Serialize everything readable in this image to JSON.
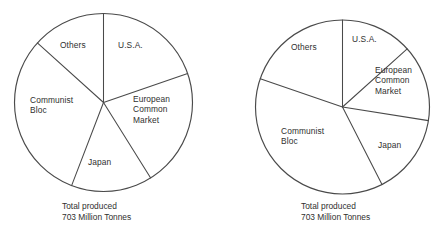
{
  "figure": {
    "width": 448,
    "height": 240,
    "background": "#ffffff",
    "stroke_color": "#4a4a4a",
    "text_color": "#30302f"
  },
  "chart_data": [
    {
      "type": "pie",
      "id": "pie-left",
      "title": "",
      "caption": "Total produced\n703 Million Tonnes",
      "total_label": "Total produced",
      "total_value_label": "703 Million Tonnes",
      "total_value": 703,
      "units": "Million Tonnes",
      "grid": false,
      "legend": "none",
      "labels_position": "inside-slice",
      "start_angle_deg": 0,
      "direction": "clockwise",
      "center": {
        "x": 103.5,
        "y": 102.5
      },
      "radius": 89,
      "categories": [
        "U.S.A.",
        "European Common Market",
        "Japan",
        "Communist Bloc",
        "Others"
      ],
      "values": [
        19.7,
        21.4,
        14.7,
        30.8,
        13.4
      ],
      "slices": [
        {
          "label": "U.S.A.",
          "start_deg": 0,
          "end_deg": 71,
          "percent": 19.7,
          "label_x": 118,
          "label_y": 40
        },
        {
          "label": "European\nCommon\nMarket",
          "start_deg": 71,
          "end_deg": 148,
          "percent": 21.4,
          "label_x": 133,
          "label_y": 94
        },
        {
          "label": "Japan",
          "start_deg": 148,
          "end_deg": 201,
          "percent": 14.7,
          "label_x": 88,
          "label_y": 157
        },
        {
          "label": "Communist\nBloc",
          "start_deg": 201,
          "end_deg": 312,
          "percent": 30.8,
          "label_x": 30,
          "label_y": 95
        },
        {
          "label": "Others",
          "start_deg": 312,
          "end_deg": 360,
          "percent": 13.4,
          "label_x": 60,
          "label_y": 40
        }
      ],
      "caption_x": 62,
      "caption_y": 201
    },
    {
      "type": "pie",
      "id": "pie-right",
      "title": "",
      "caption": "Total produced\n703 Million Tonnes",
      "total_label": "Total produced",
      "total_value_label": "703 Million Tonnes",
      "total_value": 703,
      "units": "Million Tonnes",
      "grid": false,
      "legend": "none",
      "labels_position": "inside-slice",
      "start_angle_deg": 0,
      "direction": "clockwise",
      "center": {
        "x": 342.5,
        "y": 107
      },
      "radius": 87,
      "categories": [
        "U.S.A.",
        "European Common Market",
        "Japan",
        "Communist Bloc",
        "Others"
      ],
      "values": [
        13.3,
        14.2,
        15.0,
        37.8,
        19.7
      ],
      "slices": [
        {
          "label": "U.S.A.",
          "start_deg": 0,
          "end_deg": 48,
          "percent": 13.3,
          "label_x": 352,
          "label_y": 34
        },
        {
          "label": "European\nCommon\nMarket",
          "start_deg": 48,
          "end_deg": 99,
          "percent": 14.2,
          "label_x": 375,
          "label_y": 65
        },
        {
          "label": "Japan",
          "start_deg": 99,
          "end_deg": 153,
          "percent": 15.0,
          "label_x": 378,
          "label_y": 140
        },
        {
          "label": "Communist\nBloc",
          "start_deg": 153,
          "end_deg": 289,
          "percent": 37.8,
          "label_x": 281,
          "label_y": 126
        },
        {
          "label": "Others",
          "start_deg": 289,
          "end_deg": 360,
          "percent": 19.7,
          "label_x": 291,
          "label_y": 42
        }
      ],
      "caption_x": 301,
      "caption_y": 201
    }
  ]
}
